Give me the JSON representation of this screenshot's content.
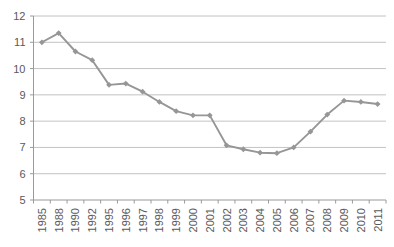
{
  "chart_data": {
    "type": "line",
    "title": "",
    "subtitle": "",
    "xlabel": "",
    "ylabel": "",
    "categories": [
      "1985",
      "1988",
      "1990",
      "1992",
      "1995",
      "1996",
      "1997",
      "1998",
      "1999",
      "2000",
      "2001",
      "2002",
      "2003",
      "2004",
      "2005",
      "2006",
      "2007",
      "2008",
      "2009",
      "2010",
      "2011"
    ],
    "series": [
      {
        "name": "",
        "values": [
          11.0,
          11.35,
          10.65,
          10.32,
          9.38,
          9.43,
          9.12,
          8.73,
          8.38,
          8.22,
          8.22,
          7.08,
          6.93,
          6.8,
          6.78,
          7.0,
          7.6,
          8.25,
          8.78,
          8.73,
          8.65
        ]
      }
    ],
    "ylim": [
      5,
      12
    ],
    "ytick_labels": [
      "12",
      "11",
      "10",
      "9",
      "8",
      "7",
      "6",
      "5"
    ],
    "ytick_values": [
      12,
      11,
      10,
      9,
      8,
      7,
      6,
      5
    ],
    "grid": true,
    "grid_axis": "y",
    "legend": false,
    "legend_position": "none",
    "marker": "diamond",
    "colors": {
      "series": "#969696",
      "gridline": "#b3b3b3",
      "axis": "#9a9a9a",
      "tick_text": "#595959",
      "background": "#ffffff"
    }
  }
}
